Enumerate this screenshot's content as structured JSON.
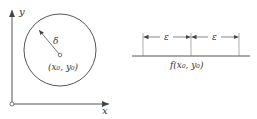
{
  "left_panel": {
    "y_axis_label": "y",
    "x_axis_label": "x",
    "radius_label": "δ",
    "center_label": "(x₀, y₀)"
  },
  "right_panel": {
    "epsilon_left": "ε",
    "epsilon_right": "ε",
    "center_label": "f(x₀, y₀)"
  },
  "colors": {
    "stroke": "#444444",
    "text": "#333333"
  }
}
